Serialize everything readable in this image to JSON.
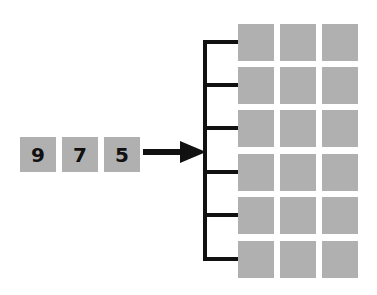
{
  "diagram": {
    "input_vector": [
      "9",
      "7",
      "5"
    ],
    "output_grid": {
      "rows": 6,
      "cols": 3
    },
    "connector": "arrow-to-bracket",
    "colors": {
      "cell": "#b0b0b0",
      "line": "#111111",
      "background": "#ffffff"
    }
  }
}
